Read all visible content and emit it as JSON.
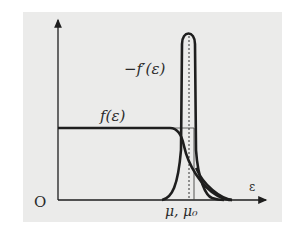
{
  "diagram": {
    "origin_label": "O",
    "x_axis_label": "ε",
    "curve_f_label": "f(ε)",
    "curve_fprime_label": "−f′(ε)",
    "tick_label": "μ, μ₀",
    "colors": {
      "background": "#ebebea",
      "ink": "#1e1e1e"
    }
  }
}
